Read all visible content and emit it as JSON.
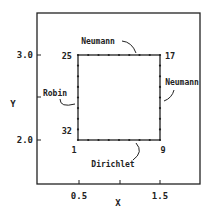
{
  "figure": {
    "x_axis": {
      "label": "X",
      "ticks": [
        "0.5",
        "1.5"
      ]
    },
    "y_axis": {
      "label": "Y",
      "ticks": [
        "3.0",
        "2.0"
      ]
    },
    "boundaries": {
      "top": "Neumann",
      "right": "Neumann",
      "left": "Robin",
      "bottom": "Dirichlet"
    },
    "corner_nodes": {
      "bottom_left": "1",
      "bottom_right": "9",
      "top_right": "17",
      "top_left": "25",
      "left_near_bottom": "32"
    }
  },
  "colors": {
    "ink": "#222222",
    "background": "#ffffff"
  }
}
